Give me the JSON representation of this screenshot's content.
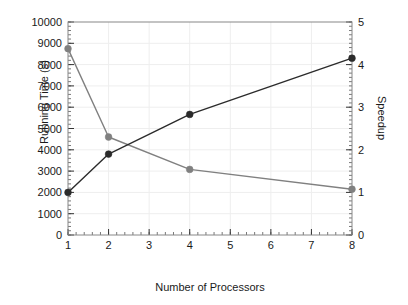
{
  "chart_data": {
    "type": "line",
    "title": "",
    "xlabel": "Number of Processors",
    "ylabel": "Running Time (s)",
    "y2label": "Speedup",
    "x": [
      1,
      2,
      4,
      8
    ],
    "xlim": [
      1,
      8
    ],
    "ylim": [
      0,
      10000
    ],
    "y2lim": [
      0,
      5
    ],
    "xticks": [
      1,
      2,
      3,
      4,
      5,
      6,
      7,
      8
    ],
    "yticks": [
      0,
      1000,
      2000,
      3000,
      4000,
      5000,
      6000,
      7000,
      8000,
      9000,
      10000
    ],
    "y2ticks": [
      0,
      1,
      2,
      3,
      4,
      5
    ],
    "xtick_labels": [
      "1",
      "2",
      "3",
      "4",
      "5",
      "6",
      "7",
      "8"
    ],
    "ytick_labels": [
      "0",
      "1000",
      "2000",
      "3000",
      "4000",
      "5000",
      "6000",
      "7000",
      "8000",
      "9000",
      "10000"
    ],
    "y2tick_labels": [
      "0",
      "1",
      "2",
      "3",
      "4",
      "5"
    ],
    "grid": true,
    "legend": "none",
    "minor_ticks": {
      "y_step": 200,
      "y2_step": 0.1,
      "x_step": 0.2
    },
    "series": [
      {
        "name": "Running Time (s)",
        "axis": "left",
        "color": "#808080",
        "marker": "circle",
        "values": [
          8750,
          4600,
          3080,
          2150
        ]
      },
      {
        "name": "Speedup",
        "axis": "right",
        "color": "#2b2b2b",
        "marker": "circle",
        "values": [
          1.0,
          1.9,
          2.83,
          4.15
        ]
      }
    ]
  },
  "labels": {
    "x_axis_title": "Number of Processors",
    "y_axis_left_title": "Running Time (s)",
    "y_axis_right_title": "Speedup"
  }
}
